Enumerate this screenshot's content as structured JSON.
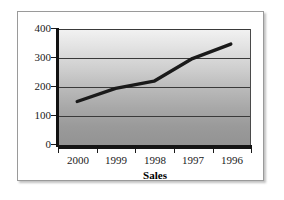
{
  "chart_data": {
    "type": "line",
    "title": "",
    "xlabel": "Sales",
    "ylabel": "",
    "categories": [
      "2000",
      "1999",
      "1998",
      "1997",
      "1996"
    ],
    "values": [
      150,
      195,
      220,
      298,
      348
    ],
    "series": [
      {
        "name": "Sales",
        "values": [
          150,
          195,
          220,
          298,
          348
        ]
      }
    ],
    "ylim": [
      0,
      400
    ],
    "yticks": [
      0,
      100,
      200,
      300,
      400
    ],
    "ytick_labels": [
      "0",
      "100",
      "200",
      "300",
      "400"
    ],
    "grid": true,
    "legend": "none",
    "line_color": "#1a1a1a",
    "plot_background": "vertical-gradient-light-to-dark-gray"
  },
  "frame": {
    "border_color": "#9a9a9a",
    "background": "#ffffff"
  },
  "axis": {
    "axis_color": "#111111",
    "gridline_color": "#3a3a3a"
  }
}
